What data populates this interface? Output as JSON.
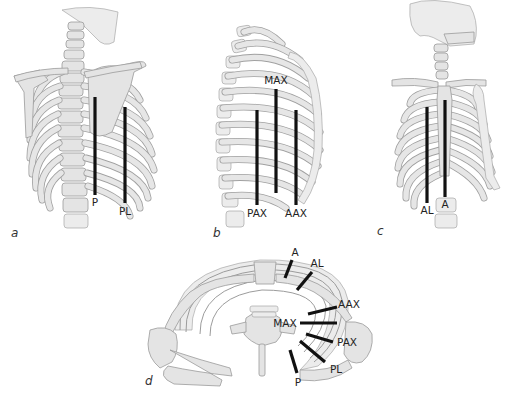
{
  "figure": {
    "panels": [
      {
        "id": "a",
        "letter": "a",
        "view": "posterior view of thorax",
        "lines": [
          {
            "label": "P",
            "x": 95,
            "y1": 97,
            "y2": 195,
            "label_x": 95,
            "label_y": 206
          },
          {
            "label": "PL",
            "x": 125,
            "y1": 107,
            "y2": 203,
            "label_x": 125,
            "label_y": 215
          }
        ]
      },
      {
        "id": "b",
        "letter": "b",
        "view": "lateral view of thorax",
        "lines": [
          {
            "label": "MAX",
            "x": 276,
            "y1": 89,
            "y2": 193,
            "label_x": 276,
            "label_y": 84
          },
          {
            "label": "PAX",
            "x": 257,
            "y1": 110,
            "y2": 205,
            "label_x": 257,
            "label_y": 217
          },
          {
            "label": "AAX",
            "x": 296,
            "y1": 110,
            "y2": 205,
            "label_x": 296,
            "label_y": 217
          }
        ]
      },
      {
        "id": "c",
        "letter": "c",
        "view": "anterior view of thorax",
        "lines": [
          {
            "label": "AL",
            "x": 427,
            "y1": 107,
            "y2": 203,
            "label_x": 427,
            "label_y": 214
          },
          {
            "label": "A",
            "x": 445,
            "y1": 100,
            "y2": 197,
            "label_x": 445,
            "label_y": 208
          }
        ]
      },
      {
        "id": "d",
        "letter": "d",
        "view": "axial (transverse) view of thorax",
        "lines": [
          {
            "label": "A",
            "x1": 292,
            "y1": 260,
            "x2": 285,
            "y2": 278,
            "label_x": 295,
            "label_y": 256
          },
          {
            "label": "AL",
            "x1": 312,
            "y1": 272,
            "x2": 297,
            "y2": 290,
            "label_x": 317,
            "label_y": 267
          },
          {
            "label": "AAX",
            "x1": 337,
            "y1": 307,
            "x2": 308,
            "y2": 314,
            "label_x": 349,
            "label_y": 308
          },
          {
            "label": "MAX",
            "x1": 300,
            "y1": 323,
            "x2": 337,
            "y2": 323,
            "label_x": 285,
            "label_y": 327
          },
          {
            "label": "PAX",
            "x1": 306,
            "y1": 334,
            "x2": 333,
            "y2": 342,
            "label_x": 347,
            "label_y": 346
          },
          {
            "label": "PL",
            "x1": 300,
            "y1": 341,
            "x2": 325,
            "y2": 362,
            "label_x": 336,
            "label_y": 373
          },
          {
            "label": "P",
            "x1": 290,
            "y1": 350,
            "x2": 297,
            "y2": 373,
            "label_x": 298,
            "label_y": 385
          }
        ]
      }
    ]
  }
}
